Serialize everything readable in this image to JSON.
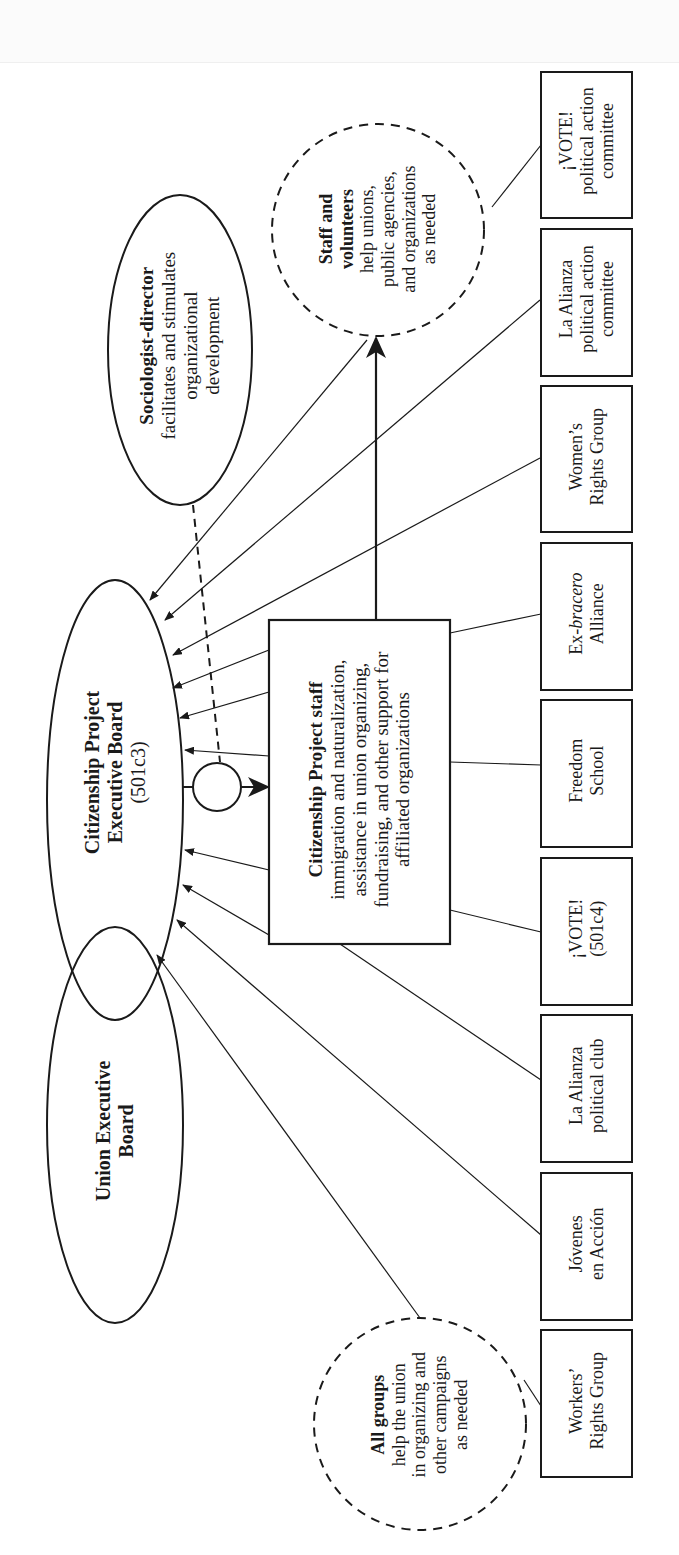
{
  "diagram": {
    "nodes": {
      "union_board": {
        "line1": "Union Executive",
        "line2": "Board"
      },
      "cp_board": {
        "line1": "Citizenship Project",
        "line2": "Executive Board",
        "line3": "(501c3)"
      },
      "sociologist": {
        "title": "Sociologist-director",
        "line1": "facilitates and stimulates",
        "line2": "organizational",
        "line3": "development"
      },
      "staff_volunteers": {
        "title1": "Staff and",
        "title2": "volunteers",
        "line1": "help unions,",
        "line2": "public agencies,",
        "line3": "and organizations",
        "line4": "as needed"
      },
      "cp_staff": {
        "title": "Citizenship Project staff",
        "line1": "immigration and naturalization,",
        "line2": "assistance in union organizing,",
        "line3": "fundraising, and other support for",
        "line4": "affiliated organizations"
      },
      "all_groups": {
        "title": "All groups",
        "line1": "help the union",
        "line2": "in organizing and",
        "line3": "other campaigns",
        "line4": "as needed"
      }
    },
    "affiliates": [
      {
        "line1": "¡VOTE!",
        "line2": "political action",
        "line3": "committee"
      },
      {
        "line1": "La Alianza",
        "line2": "political action",
        "line3": "committee"
      },
      {
        "line1": "Women’s",
        "line2": "Rights Group"
      },
      {
        "line1_prefix": "Ex-",
        "line1_italic": "bracero",
        "line2": "Alliance"
      },
      {
        "line1": "Freedom",
        "line2": "School"
      },
      {
        "line1": "¡VOTE!",
        "line2": "(501c4)"
      },
      {
        "line1": "La Alianza",
        "line2": "political club"
      },
      {
        "line1": "Jóvenes",
        "line2": "en Acción"
      },
      {
        "line1": "Workers’",
        "line2": "Rights Group"
      }
    ],
    "colors": {
      "ink": "#1a1a1a",
      "background": "#ffffff"
    }
  }
}
